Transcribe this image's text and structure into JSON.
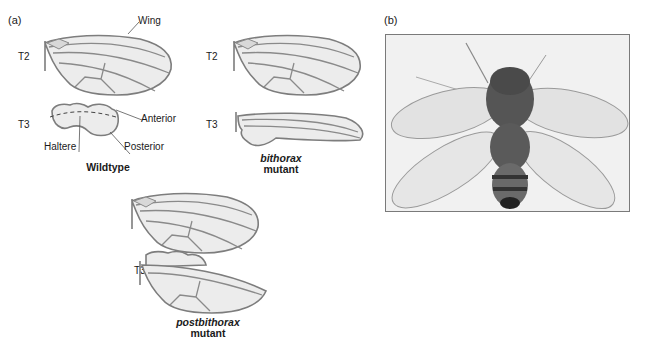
{
  "panel_a": {
    "label": "(a)",
    "wildtype": {
      "t2_label": "T2",
      "t3_label": "T3",
      "callouts": {
        "wing": "Wing",
        "anterior": "Anterior",
        "posterior": "Posterior",
        "haltere": "Haltere"
      },
      "caption": "Wildtype"
    },
    "bithorax": {
      "t2_label": "T2",
      "t3_label": "T3",
      "caption_italic": "bithorax",
      "caption_line2": "mutant"
    },
    "postbithorax": {
      "t2_label": "T2",
      "t3_label": "T3",
      "caption_italic": "postbithorax",
      "caption_line2": "mutant"
    }
  },
  "panel_b": {
    "label": "(b)",
    "photo_subject": "four-winged-fly"
  },
  "colors": {
    "wing_outline": "#7d7d7d",
    "wing_fill": "#ececec",
    "text": "#1a1a1a",
    "photo_bg": "#f1f1f1",
    "fly_body": "#3a3a3a"
  }
}
